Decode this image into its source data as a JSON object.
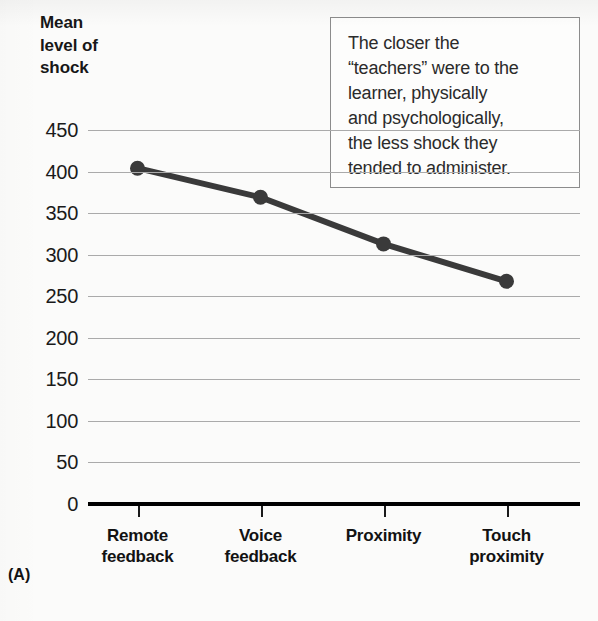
{
  "figure": {
    "panel_label": "(A)",
    "y_axis_title": "Mean\nlevel of\nshock",
    "callout": "The closer the\n“teachers” were to the\nlearner, physically\nand psychologically,\nthe less shock they\ntended to administer.",
    "colors": {
      "line": "#3a3a3a",
      "marker": "#3a3a3a",
      "gridline": "#aaaaaa",
      "axis": "#000000",
      "text": "#171717",
      "callout_border": "#8c8c8c",
      "background": "#fbfbfa"
    }
  },
  "chart_data": {
    "type": "line",
    "title": "",
    "xlabel": "",
    "ylabel": "Mean level of shock",
    "categories": [
      "Remote\nfeedback",
      "Voice\nfeedback",
      "Proximity",
      "Touch\nproximity"
    ],
    "values": [
      404,
      369,
      313,
      268
    ],
    "series": [
      {
        "name": "Mean level of shock",
        "values": [
          404,
          369,
          313,
          268
        ]
      }
    ],
    "ylim": [
      0,
      450
    ],
    "ytick_labels": [
      "450",
      "400",
      "350",
      "300",
      "250",
      "200",
      "150",
      "100",
      "50",
      "0"
    ],
    "ytick_values": [
      450,
      400,
      350,
      300,
      250,
      200,
      150,
      100,
      50,
      0
    ],
    "grid": true,
    "legend": false,
    "annotations": [
      "The closer the “teachers” were to the learner, physically and psychologically, the less shock they tended to administer."
    ]
  }
}
